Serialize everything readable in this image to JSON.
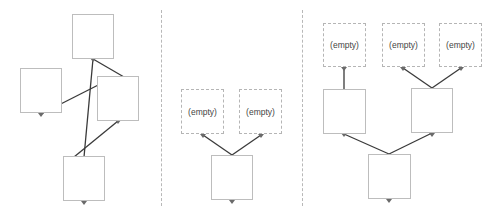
{
  "diagram": {
    "panels": [
      {
        "id": "panel-1",
        "nodes": [
          {
            "id": "p1-top",
            "x": 72,
            "y": 14,
            "w": 42,
            "h": 45,
            "label": "",
            "empty": false
          },
          {
            "id": "p1-left",
            "x": 20,
            "y": 68,
            "w": 42,
            "h": 45,
            "label": "",
            "empty": false
          },
          {
            "id": "p1-right",
            "x": 97,
            "y": 76,
            "w": 42,
            "h": 45,
            "label": "",
            "empty": false
          },
          {
            "id": "p1-bottom",
            "x": 63,
            "y": 156,
            "w": 42,
            "h": 45,
            "label": "",
            "empty": false
          }
        ]
      },
      {
        "id": "panel-2",
        "nodes": [
          {
            "id": "p2-left",
            "x": 181,
            "y": 89,
            "w": 43,
            "h": 45,
            "label": "(empty)",
            "empty": true
          },
          {
            "id": "p2-right",
            "x": 239,
            "y": 89,
            "w": 43,
            "h": 45,
            "label": "(empty)",
            "empty": true
          },
          {
            "id": "p2-bottom",
            "x": 211,
            "y": 155,
            "w": 42,
            "h": 45,
            "label": "",
            "empty": false
          }
        ]
      },
      {
        "id": "panel-3",
        "nodes": [
          {
            "id": "p3-e1",
            "x": 323,
            "y": 23,
            "w": 43,
            "h": 44,
            "label": "(empty)",
            "empty": true
          },
          {
            "id": "p3-e2",
            "x": 382,
            "y": 23,
            "w": 43,
            "h": 44,
            "label": "(empty)",
            "empty": true
          },
          {
            "id": "p3-e3",
            "x": 439,
            "y": 23,
            "w": 43,
            "h": 44,
            "label": "(empty)",
            "empty": true
          },
          {
            "id": "p3-mid-left",
            "x": 323,
            "y": 89,
            "w": 43,
            "h": 45,
            "label": "",
            "empty": false
          },
          {
            "id": "p3-mid-right",
            "x": 411,
            "y": 88,
            "w": 42,
            "h": 45,
            "label": "",
            "empty": false
          },
          {
            "id": "p3-bottom",
            "x": 368,
            "y": 154,
            "w": 43,
            "h": 45,
            "label": "",
            "empty": false
          }
        ]
      }
    ],
    "labels": {
      "empty": "(empty)"
    },
    "colors": {
      "edge": "#3a3a3a",
      "border": "#bdbdbd",
      "port": "#6a6a6a"
    }
  }
}
